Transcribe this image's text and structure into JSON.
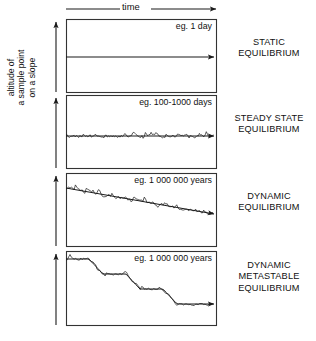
{
  "figure": {
    "axis": {
      "y_label_lines": [
        "altitude of",
        "a sample point",
        "on a slope"
      ],
      "x_label": "time",
      "x_arrow_start_x": 66,
      "x_arrow_end_x": 216,
      "x_arrow_y": 9
    },
    "panels": [
      {
        "id": "static",
        "timescale_label": "eg. 1 day",
        "state_label_lines": [
          "STATIC",
          "EQUILIBRIUM"
        ],
        "box": {
          "x": 66,
          "y": 19,
          "w": 150,
          "h": 73
        },
        "label_pos": {
          "x": 130,
          "y": 21
        },
        "state_pos_y": 48,
        "trace": {
          "kind": "flat",
          "start_y": 57,
          "end_y": 57,
          "noise": 0,
          "steps": 0,
          "arrow": true
        }
      },
      {
        "id": "steady-state",
        "timescale_label": "eg. 100-1000 days",
        "state_label_lines": [
          "STEADY STATE",
          "EQUILIBRIUM"
        ],
        "box": {
          "x": 66,
          "y": 95,
          "w": 150,
          "h": 73
        },
        "label_pos": {
          "x": 118,
          "y": 97
        },
        "state_pos_y": 124,
        "trace": {
          "kind": "noisy-flat",
          "start_y": 136,
          "end_y": 136,
          "noise": 5,
          "steps": 0,
          "arrow": true
        }
      },
      {
        "id": "dynamic",
        "timescale_label": "eg. 1 000 000 years",
        "state_label_lines": [
          "DYNAMIC",
          "EQUILIBRIUM"
        ],
        "box": {
          "x": 66,
          "y": 173,
          "w": 150,
          "h": 73
        },
        "label_pos": {
          "x": 122,
          "y": 175
        },
        "state_pos_y": 202,
        "trace": {
          "kind": "noisy-trend",
          "start_y": 188,
          "end_y": 214,
          "noise": 6,
          "steps": 0,
          "arrow": true
        }
      },
      {
        "id": "dynamic-metastable",
        "timescale_label": "eg. 1 000 000 years",
        "state_label_lines": [
          "DYNAMIC",
          "METASTABLE",
          "EQUILIBRIUM"
        ],
        "box": {
          "x": 66,
          "y": 251,
          "w": 150,
          "h": 74
        },
        "label_pos": {
          "x": 122,
          "y": 253
        },
        "state_pos_y": 277,
        "trace": {
          "kind": "staircase",
          "start_y": 259,
          "end_y": 304,
          "noise": 4,
          "steps": 4,
          "plateau_levels": [
            259,
            274,
            289,
            304
          ],
          "arrow": true
        }
      }
    ],
    "y_arrows": [
      {
        "x": 56,
        "y_top": 22,
        "y_bottom": 92
      },
      {
        "x": 56,
        "y_top": 98,
        "y_bottom": 168
      },
      {
        "x": 56,
        "y_top": 176,
        "y_bottom": 246
      },
      {
        "x": 56,
        "y_top": 254,
        "y_bottom": 325
      }
    ],
    "colors": {
      "ink": "#1a1a1a",
      "box_stroke": "#333333",
      "background": "#ffffff"
    }
  }
}
